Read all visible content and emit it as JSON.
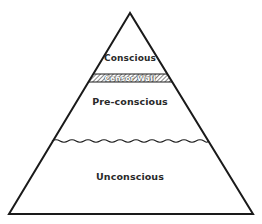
{
  "diagram": {
    "type": "pyramid",
    "layers": [
      {
        "id": "conscious",
        "label": "Conscious"
      },
      {
        "id": "censor-wall",
        "label": "Censor Wall"
      },
      {
        "id": "preconscious",
        "label": "Pre-conscious"
      },
      {
        "id": "unconscious",
        "label": "Unconscious"
      }
    ],
    "colors": {
      "stroke": "#1a1a1a",
      "background": "#ffffff",
      "hatch": "#333333"
    }
  }
}
